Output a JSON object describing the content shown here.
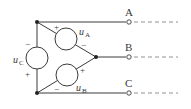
{
  "diagram": {
    "type": "three-phase delta-connected voltage source circuit",
    "colors": {
      "line": "#3a3a3a",
      "dashed": "#777777",
      "background": "#ffffff"
    },
    "sources": [
      {
        "name": "uA",
        "label_main": "u",
        "label_sub": "A",
        "plus": "+",
        "minus": "−"
      },
      {
        "name": "uB",
        "label_main": "u",
        "label_sub": "B",
        "plus": "+",
        "minus": "−"
      },
      {
        "name": "uC",
        "label_main": "u",
        "label_sub": "C",
        "plus": "+",
        "minus": "−"
      }
    ],
    "terminals": [
      {
        "name": "A",
        "label": "A"
      },
      {
        "name": "B",
        "label": "B"
      },
      {
        "name": "C",
        "label": "C"
      }
    ]
  }
}
